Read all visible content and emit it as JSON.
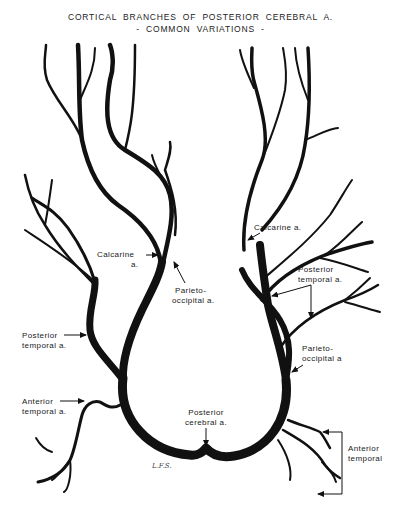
{
  "title": {
    "line1": "CORTICAL BRANCHES OF POSTERIOR CEREBRAL A.",
    "line2": "- COMMON VARIATIONS -"
  },
  "labels": {
    "left_calcarine": [
      "Calcarine",
      "a."
    ],
    "left_parieto_occipital": [
      "Parieto-",
      "occipital a."
    ],
    "left_posterior_temporal": [
      "Posterior",
      "temporal a."
    ],
    "left_anterior_temporal": [
      "Anterior",
      "temporal a."
    ],
    "posterior_cerebral": [
      "Posterior",
      "cerebral a."
    ],
    "right_calcarine": [
      "Calcarine a."
    ],
    "right_posterior_temporal": [
      "Posterior",
      "temporal a."
    ],
    "right_parieto_occipital": [
      "Parieto-",
      "occipital a"
    ],
    "right_anterior_temporal": [
      "Anterior",
      "temporal"
    ]
  },
  "signature": "L.F.S.",
  "colors": {
    "ink": "#111111",
    "background": "#ffffff"
  }
}
